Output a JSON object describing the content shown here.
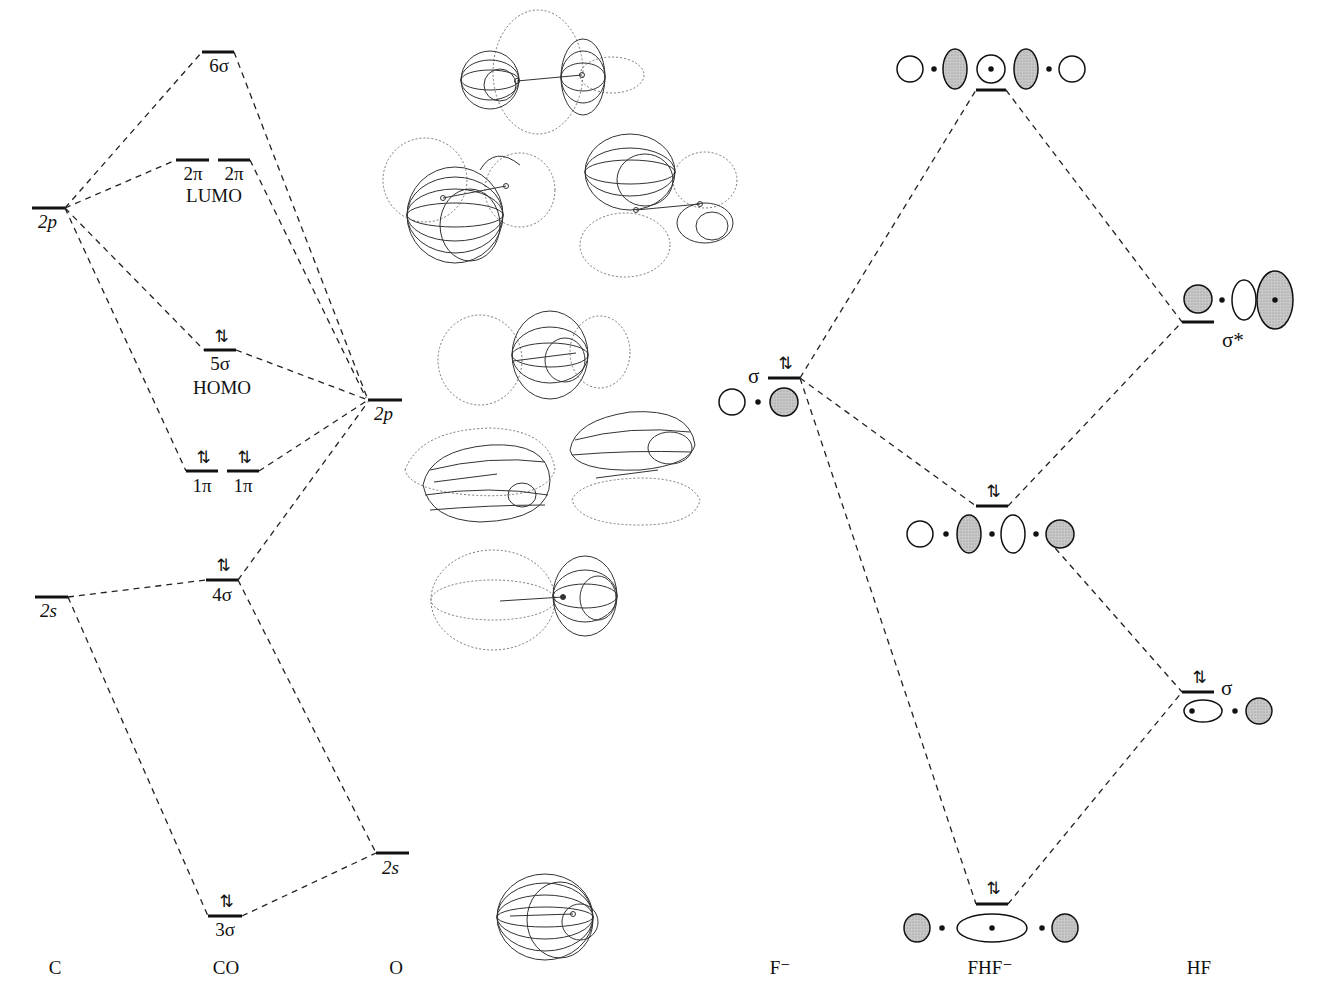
{
  "co_diagram": {
    "columns": {
      "left": "C",
      "middle": "CO",
      "right": "O"
    },
    "carbon_levels": [
      {
        "label": "2p",
        "y": 208
      },
      {
        "label": "2s",
        "y": 597
      }
    ],
    "oxygen_levels": [
      {
        "label": "2p",
        "y": 400
      },
      {
        "label": "2s",
        "y": 853
      }
    ],
    "mo_levels": [
      {
        "label": "6σ",
        "occupancy": "",
        "note": ""
      },
      {
        "label": "2π",
        "occupancy": "",
        "note": "LUMO",
        "degenerate": true
      },
      {
        "label": "5σ",
        "occupancy": "⇅",
        "note": "HOMO"
      },
      {
        "label": "1π",
        "occupancy": "⇅",
        "note": "",
        "degenerate": true
      },
      {
        "label": "4σ",
        "occupancy": "⇅",
        "note": ""
      },
      {
        "label": "3σ",
        "occupancy": "⇅",
        "note": ""
      }
    ],
    "lumo_label": "LUMO",
    "homo_label": "HOMO"
  },
  "orbital_renders": [
    {
      "name": "6σ orbital surface",
      "atoms": [
        "C",
        "O"
      ]
    },
    {
      "name": "2π orbital surface (a)"
    },
    {
      "name": "2π orbital surface (b)"
    },
    {
      "name": "5σ orbital surface"
    },
    {
      "name": "1π orbital surface (a)"
    },
    {
      "name": "1π orbital surface (b)"
    },
    {
      "name": "4σ orbital surface"
    },
    {
      "name": "3σ orbital surface"
    }
  ],
  "fhf_diagram": {
    "columns": {
      "left": "F⁻",
      "middle": "FHF⁻",
      "right": "HF"
    },
    "f_minus_level": {
      "label": "σ",
      "occupancy": "⇅"
    },
    "hf_levels": [
      {
        "label": "σ*",
        "occupancy": ""
      },
      {
        "label": "σ",
        "occupancy": "⇅"
      }
    ],
    "fhf_levels": [
      {
        "position": "top",
        "occupancy": ""
      },
      {
        "position": "middle",
        "occupancy": "⇅"
      },
      {
        "position": "bottom",
        "occupancy": "⇅"
      }
    ]
  },
  "colors": {
    "ink": "#111111",
    "shade": "#bdbdbd",
    "dash": "#222222"
  }
}
